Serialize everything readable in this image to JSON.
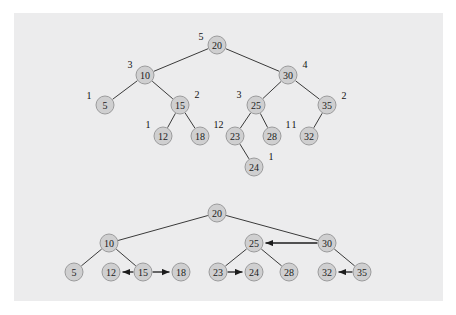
{
  "figure": {
    "background_color": "#ffffff",
    "panel_color": "#ececed",
    "node_fill_color": "#cfcfd0",
    "node_stroke_color": "#9b9b9c",
    "edge_color": "#3a3a3a",
    "text_color": "#1b1b1b"
  },
  "top_tree": {
    "caption": "",
    "nodes": [
      {
        "id": "t20",
        "label": "20",
        "annotation": "5",
        "x": 217,
        "y": 45,
        "annotation_x": 201,
        "annotation_y": 36
      },
      {
        "id": "t10",
        "label": "10",
        "annotation": "3",
        "x": 145,
        "y": 75,
        "annotation_x": 130,
        "annotation_y": 64
      },
      {
        "id": "t30",
        "label": "30",
        "annotation": "4",
        "x": 288,
        "y": 75,
        "annotation_x": 305,
        "annotation_y": 64
      },
      {
        "id": "t5",
        "label": "5",
        "annotation": "1",
        "x": 105,
        "y": 105,
        "annotation_x": 89,
        "annotation_y": 95
      },
      {
        "id": "t15",
        "label": "15",
        "annotation": "2",
        "x": 180,
        "y": 105,
        "annotation_x": 197,
        "annotation_y": 94
      },
      {
        "id": "t25",
        "label": "25",
        "annotation": "3",
        "x": 256,
        "y": 105,
        "annotation_x": 239,
        "annotation_y": 94
      },
      {
        "id": "t35",
        "label": "35",
        "annotation": "2",
        "x": 327,
        "y": 105,
        "annotation_x": 344,
        "annotation_y": 95
      },
      {
        "id": "t12",
        "label": "12",
        "annotation": "1",
        "x": 163,
        "y": 136,
        "annotation_x": 148,
        "annotation_y": 124
      },
      {
        "id": "t18",
        "label": "18",
        "annotation": "1",
        "x": 200,
        "y": 136,
        "annotation_x": 216,
        "annotation_y": 124
      },
      {
        "id": "t23",
        "label": "23",
        "annotation": "2",
        "x": 235,
        "y": 136,
        "annotation_x": 221,
        "annotation_y": 124
      },
      {
        "id": "t28",
        "label": "28",
        "annotation": "1",
        "x": 272,
        "y": 136,
        "annotation_x": 288,
        "annotation_y": 124
      },
      {
        "id": "t32",
        "label": "32",
        "annotation": "1",
        "x": 309,
        "y": 136,
        "annotation_x": 294,
        "annotation_y": 124
      },
      {
        "id": "t24",
        "label": "24",
        "annotation": "1",
        "x": 254,
        "y": 167,
        "annotation_x": 271,
        "annotation_y": 156
      }
    ],
    "edges": [
      {
        "from": "t20",
        "to": "t10"
      },
      {
        "from": "t20",
        "to": "t30"
      },
      {
        "from": "t10",
        "to": "t5"
      },
      {
        "from": "t10",
        "to": "t15"
      },
      {
        "from": "t15",
        "to": "t12"
      },
      {
        "from": "t15",
        "to": "t18"
      },
      {
        "from": "t30",
        "to": "t25"
      },
      {
        "from": "t30",
        "to": "t35"
      },
      {
        "from": "t25",
        "to": "t23"
      },
      {
        "from": "t25",
        "to": "t28"
      },
      {
        "from": "t35",
        "to": "t32"
      },
      {
        "from": "t23",
        "to": "t24"
      }
    ]
  },
  "bottom_tree": {
    "caption": "",
    "nodes": [
      {
        "id": "b20",
        "label": "20",
        "x": 217,
        "y": 213
      },
      {
        "id": "b10",
        "label": "10",
        "x": 109,
        "y": 243
      },
      {
        "id": "b25",
        "label": "25",
        "x": 254,
        "y": 243
      },
      {
        "id": "b30",
        "label": "30",
        "x": 327,
        "y": 243
      },
      {
        "id": "b5",
        "label": "5",
        "x": 74,
        "y": 272
      },
      {
        "id": "b12",
        "label": "12",
        "x": 111,
        "y": 272
      },
      {
        "id": "b15",
        "label": "15",
        "x": 143,
        "y": 272
      },
      {
        "id": "b18",
        "label": "18",
        "x": 181,
        "y": 272
      },
      {
        "id": "b23",
        "label": "23",
        "x": 218,
        "y": 272
      },
      {
        "id": "b24",
        "label": "24",
        "x": 254,
        "y": 272
      },
      {
        "id": "b28",
        "label": "28",
        "x": 289,
        "y": 272
      },
      {
        "id": "b32",
        "label": "32",
        "x": 327,
        "y": 272
      },
      {
        "id": "b35",
        "label": "35",
        "x": 362,
        "y": 272
      }
    ],
    "edges": [
      {
        "from": "b20",
        "to": "b10"
      },
      {
        "from": "b20",
        "to": "b30"
      },
      {
        "from": "b10",
        "to": "b5"
      },
      {
        "from": "b10",
        "to": "b15"
      },
      {
        "from": "b25",
        "to": "b23"
      },
      {
        "from": "b25",
        "to": "b28"
      },
      {
        "from": "b30",
        "to": "b35"
      }
    ],
    "threads": [
      {
        "from": "b30",
        "to": "b25",
        "direction": "left"
      },
      {
        "from": "b15",
        "to": "b12",
        "direction": "left"
      },
      {
        "from": "b15",
        "to": "b18",
        "direction": "right"
      },
      {
        "from": "b23",
        "to": "b24",
        "direction": "right"
      },
      {
        "from": "b35",
        "to": "b32",
        "direction": "left"
      }
    ]
  }
}
